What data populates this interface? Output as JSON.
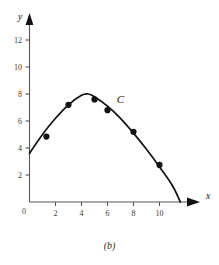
{
  "caption": "(b)",
  "chart_data": {
    "type": "scatter",
    "title": "",
    "subtitle": "",
    "xlabel": "x",
    "ylabel": "y",
    "xlim": [
      0,
      11.9
    ],
    "ylim": [
      0,
      13.2
    ],
    "grid": false,
    "legend_position": "none",
    "x_ticks": [
      0,
      2,
      4,
      6,
      8,
      10
    ],
    "y_ticks": [
      0,
      2,
      4,
      6,
      8,
      10,
      12
    ],
    "x_tick_labels": [
      "0",
      "2",
      "4",
      "6",
      "8",
      "10"
    ],
    "y_tick_labels": [
      "0",
      "2",
      "4",
      "6",
      "8",
      "10",
      "12"
    ],
    "origin_label": "0",
    "annotations": [
      {
        "text": "C",
        "x": 7.0,
        "y": 7.3,
        "style": "italic",
        "name": "curve-label-c"
      }
    ],
    "series": [
      {
        "name": "data points",
        "marker": "filled-circle",
        "color": "#111111",
        "points": [
          {
            "x": 1.3,
            "y": 4.85
          },
          {
            "x": 3.0,
            "y": 7.2
          },
          {
            "x": 5.0,
            "y": 7.6
          },
          {
            "x": 6.0,
            "y": 6.8
          },
          {
            "x": 8.0,
            "y": 5.2
          },
          {
            "x": 10.0,
            "y": 2.75
          }
        ]
      },
      {
        "name": "fitted curve C",
        "marker": "none",
        "color": "#111111",
        "curve": [
          {
            "x": 0.0,
            "y": 3.6
          },
          {
            "x": 1.0,
            "y": 5.0
          },
          {
            "x": 2.0,
            "y": 6.2
          },
          {
            "x": 3.0,
            "y": 7.2
          },
          {
            "x": 4.0,
            "y": 7.9
          },
          {
            "x": 4.5,
            "y": 8.0
          },
          {
            "x": 5.0,
            "y": 7.8
          },
          {
            "x": 6.0,
            "y": 7.1
          },
          {
            "x": 7.0,
            "y": 6.2
          },
          {
            "x": 8.0,
            "y": 5.1
          },
          {
            "x": 9.0,
            "y": 3.9
          },
          {
            "x": 10.0,
            "y": 2.6
          },
          {
            "x": 11.0,
            "y": 1.2
          },
          {
            "x": 11.6,
            "y": 0.0
          }
        ]
      }
    ],
    "axis_arrows": {
      "x": true,
      "y": true
    },
    "colors": {
      "axis": "#555555",
      "curve": "#111111",
      "marker": "#111111",
      "background": "#ffffff"
    }
  }
}
